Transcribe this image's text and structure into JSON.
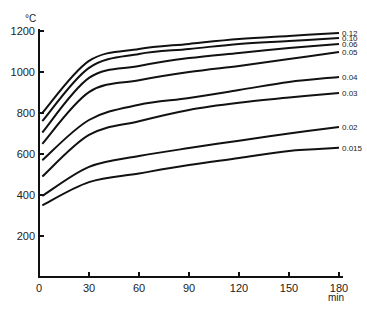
{
  "chart_data": {
    "type": "line",
    "title": "",
    "xlabel": "min",
    "ylabel": "°C",
    "xlim": [
      0,
      180
    ],
    "ylim": [
      0,
      1200
    ],
    "grid": false,
    "legend_position": "inline-right",
    "x_ticks": [
      0,
      30,
      60,
      90,
      120,
      150,
      180
    ],
    "y_ticks": [
      200,
      400,
      600,
      800,
      1000,
      1200
    ],
    "x": [
      2,
      30,
      60,
      90,
      120,
      150,
      180
    ],
    "series": [
      {
        "name": "0.12",
        "values": [
          800,
          1054,
          1112,
          1137,
          1161,
          1176,
          1190
        ]
      },
      {
        "name": "0.10",
        "values": [
          760,
          1020,
          1088,
          1112,
          1137,
          1151,
          1166
        ]
      },
      {
        "name": "0.06",
        "values": [
          705,
          971,
          1029,
          1068,
          1093,
          1117,
          1137
        ]
      },
      {
        "name": "0.05",
        "values": [
          650,
          902,
          960,
          1000,
          1030,
          1063,
          1098
        ]
      },
      {
        "name": "0.04",
        "values": [
          570,
          766,
          840,
          873,
          912,
          951,
          976
        ]
      },
      {
        "name": "0.03",
        "values": [
          490,
          693,
          760,
          815,
          850,
          875,
          898
        ]
      },
      {
        "name": "0.02",
        "values": [
          395,
          537,
          590,
          629,
          665,
          700,
          732
        ]
      },
      {
        "name": "0.015",
        "values": [
          350,
          463,
          505,
          546,
          580,
          615,
          630
        ]
      }
    ]
  },
  "axes": {
    "y_unit": "°C",
    "x_unit": "min"
  }
}
